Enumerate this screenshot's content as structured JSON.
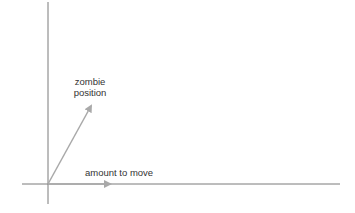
{
  "diagram": {
    "labels": {
      "zombie_line1": "zombie",
      "zombie_line2": "position",
      "amount_to_move": "amount to move"
    },
    "colors": {
      "axis": "#7a7a7a",
      "arrow": "#a9a9a9",
      "text": "#333333",
      "background": "#ffffff"
    },
    "vectors": [
      {
        "name": "zombie-position",
        "from": [
          48,
          184
        ],
        "to": [
          92,
          104
        ]
      },
      {
        "name": "amount-to-move",
        "from": [
          48,
          184
        ],
        "to": [
          112,
          184
        ]
      }
    ]
  }
}
